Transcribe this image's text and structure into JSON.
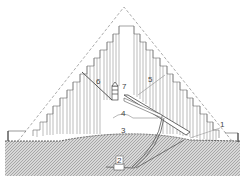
{
  "diagram": {
    "type": "pyramid-cross-section",
    "labels": [
      {
        "id": "1",
        "text": "1",
        "x": 222,
        "y": 126
      },
      {
        "id": "2",
        "text": "2",
        "x": 119,
        "y": 163
      },
      {
        "id": "3",
        "text": "3",
        "x": 122,
        "y": 131
      },
      {
        "id": "4",
        "text": "4",
        "x": 123,
        "y": 116
      },
      {
        "id": "5",
        "text": "5",
        "x": 150,
        "y": 82
      },
      {
        "id": "6",
        "text": "6",
        "x": 99,
        "y": 83
      },
      {
        "id": "7",
        "text": "7",
        "x": 124,
        "y": 88
      }
    ],
    "colors": {
      "line": "#555555",
      "dashed": "#888888",
      "ground_fill": "#bdbdbd",
      "background": "#ffffff"
    }
  }
}
